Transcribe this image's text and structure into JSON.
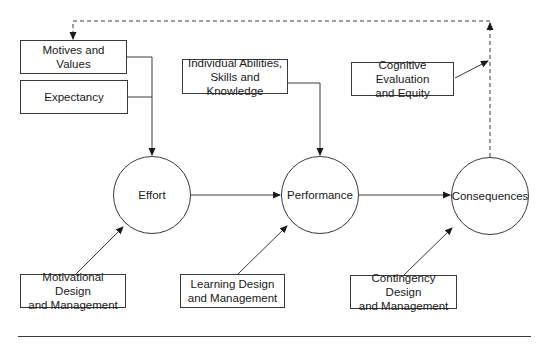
{
  "diagram": {
    "boxes": {
      "motives": "Motives and Values",
      "expectancy": "Expectancy",
      "abilities": "Individual Abilities,\nSkills and Knowledge",
      "cognitive": "Cognitive Evaluation\nand Equity",
      "motivational": "Motivational Design\nand Management",
      "learning": "Learning Design\nand Management",
      "contingency": "Contingency Design\nand Management"
    },
    "nodes": {
      "effort": "Effort",
      "performance": "Performance",
      "consequences": "Consequences"
    },
    "colors": {
      "stroke": "#3a3a3a",
      "background": "#ffffff",
      "text": "#1a1a1a"
    }
  }
}
